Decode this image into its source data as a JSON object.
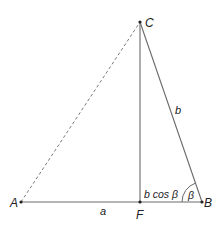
{
  "diagram": {
    "title": "",
    "colors": {
      "line": "#6a6a6a",
      "dashed": "#7a7a7a",
      "point": "#222222",
      "text": "#222222",
      "background": "#ffffff"
    },
    "points": {
      "A": {
        "label": "A",
        "x": 21,
        "y": 202
      },
      "B": {
        "label": "B",
        "x": 202,
        "y": 202
      },
      "C": {
        "label": "C",
        "x": 140,
        "y": 22
      },
      "F": {
        "label": "F",
        "x": 140,
        "y": 202
      }
    },
    "segments": [
      {
        "from": "A",
        "to": "B",
        "style": "solid"
      },
      {
        "from": "C",
        "to": "F",
        "style": "solid"
      },
      {
        "from": "C",
        "to": "B",
        "style": "solid"
      },
      {
        "from": "A",
        "to": "C",
        "style": "dashed"
      }
    ],
    "labels": {
      "side_a": "a",
      "side_b": "b",
      "projection": "b cos β",
      "angle": "β"
    }
  }
}
